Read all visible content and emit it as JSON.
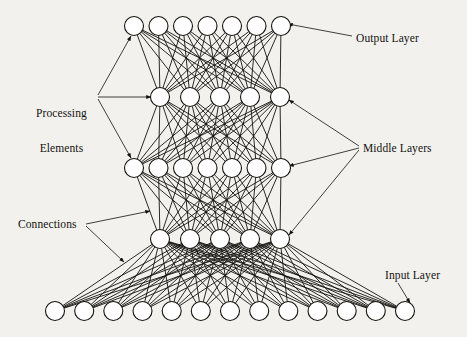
{
  "figure": {
    "kind": "neural-network-architecture-diagram",
    "background_color": "#f2f1ee",
    "ink_color": "#14120f",
    "node_fill": "#ffffff",
    "width": 467,
    "height": 337
  },
  "labels": {
    "output_layer": "Output Layer",
    "middle_layers": "Middle Layers",
    "input_layer": "Input Layer",
    "processing_elements_line1": "Processing",
    "processing_elements_line2": "Elements",
    "connections": "Connections"
  },
  "network": {
    "layer_count": 5,
    "layers": [
      {
        "name": "output-layer",
        "role": "output",
        "node_count": 7,
        "y": 26,
        "radius": 9.5,
        "x_positions": [
          134,
          158.5,
          183,
          207.5,
          232,
          256.5,
          281
        ]
      },
      {
        "name": "middle-layer-1",
        "role": "middle",
        "node_count": 5,
        "y": 97,
        "radius": 9.5,
        "x_positions": [
          160,
          190,
          220,
          250,
          280
        ]
      },
      {
        "name": "middle-layer-2",
        "role": "middle",
        "node_count": 7,
        "y": 168,
        "radius": 9.5,
        "x_positions": [
          134,
          158.5,
          183,
          207.5,
          232,
          256.5,
          281
        ]
      },
      {
        "name": "middle-layer-3",
        "role": "middle",
        "node_count": 5,
        "y": 239,
        "radius": 9.5,
        "x_positions": [
          160,
          190,
          220,
          250,
          280
        ]
      },
      {
        "name": "input-layer",
        "role": "input",
        "node_count": 13,
        "y": 311,
        "radius": 9.5,
        "x_positions": [
          55,
          84.2,
          113.3,
          142.5,
          171.7,
          200.8,
          230,
          259.2,
          288.3,
          317.5,
          346.7,
          375.8,
          405
        ]
      }
    ],
    "connection_style": {
      "fully_connected": true,
      "stroke_width": 0.9,
      "color": "#14120f"
    }
  },
  "annotations": [
    {
      "name": "output-layer-callout",
      "text_key": "output_layer",
      "leaders": [
        {
          "from": [
            352,
            36
          ],
          "to": [
            288,
            24
          ]
        }
      ]
    },
    {
      "name": "middle-layers-callout",
      "text_key": "middle_layers",
      "leaders": [
        {
          "from": [
            359,
            146
          ],
          "to": [
            289,
            100
          ]
        },
        {
          "from": [
            359,
            148
          ],
          "to": [
            289,
            166
          ]
        },
        {
          "from": [
            359,
            150
          ],
          "to": [
            289,
            235
          ]
        }
      ]
    },
    {
      "name": "input-layer-callout",
      "text_key": "input_layer",
      "leaders": [
        {
          "from": [
            398,
            283
          ],
          "to": [
            410,
            303
          ]
        }
      ]
    },
    {
      "name": "processing-elements-callout",
      "text_key": "processing_elements",
      "leaders": [
        {
          "from": [
            98,
            95
          ],
          "to": [
            131,
            36
          ]
        },
        {
          "from": [
            98,
            97
          ],
          "to": [
            151,
            97
          ]
        },
        {
          "from": [
            98,
            99
          ],
          "to": [
            131,
            158
          ]
        }
      ]
    },
    {
      "name": "connections-callout",
      "text_key": "connections",
      "leaders": [
        {
          "from": [
            86,
            224
          ],
          "to": [
            150,
            211
          ]
        },
        {
          "from": [
            86,
            226
          ],
          "to": [
            124,
            262
          ]
        }
      ]
    }
  ]
}
